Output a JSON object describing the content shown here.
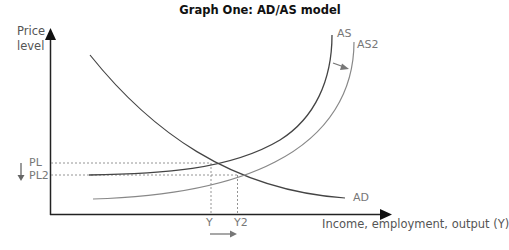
{
  "title": "Graph One: AD/AS model",
  "axes": {
    "y_label_line1": "Price",
    "y_label_line2": "level",
    "x_label": "Income, employment, output (Y)"
  },
  "curves": {
    "ad_label": "AD",
    "as_label": "AS",
    "as2_label": "AS2"
  },
  "price_levels": {
    "pl": "PL",
    "pl2": "PL2"
  },
  "outputs": {
    "y": "Y",
    "y2": "Y2"
  },
  "colors": {
    "axis": "#222222",
    "ad": "#444444",
    "as": "#444444",
    "as2": "#888888",
    "guide": "#888888",
    "label": "#777777"
  }
}
